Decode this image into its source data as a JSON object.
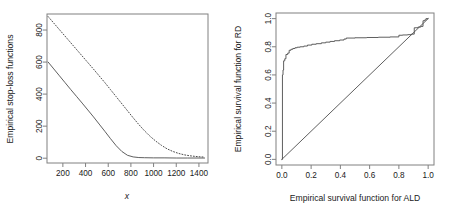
{
  "figure": {
    "panels": [
      {
        "id": "left",
        "name": "empirical-stop-loss-plot",
        "chart_ref": 0
      },
      {
        "id": "right",
        "name": "empirical-survival-pp-plot",
        "chart_ref": 1
      }
    ]
  },
  "chart_data": [
    {
      "type": "line",
      "title": "",
      "xlabel": "x",
      "ylabel": "Empirical stop-loss functions",
      "xlim": [
        60,
        1480
      ],
      "ylim": [
        -30,
        900
      ],
      "grid": false,
      "legend": null,
      "xticks": [
        200,
        400,
        600,
        800,
        1000,
        1200,
        1400
      ],
      "xticklabels": [
        "200",
        "400",
        "600",
        "800",
        "1000",
        "1200",
        "1400"
      ],
      "yticks": [
        0,
        200,
        400,
        600,
        800
      ],
      "yticklabels": [
        "0",
        "200",
        "400",
        "600",
        "800"
      ],
      "series": [
        {
          "name": "solid-stop-loss",
          "style": "solid",
          "color": "#4d4d4d",
          "x": [
            70,
            120,
            170,
            220,
            270,
            320,
            370,
            420,
            470,
            520,
            570,
            620,
            670,
            720,
            770,
            820,
            870,
            920,
            1000,
            1100,
            1200,
            1300,
            1400,
            1450
          ],
          "y": [
            600,
            557,
            514,
            471,
            428,
            386,
            344,
            301,
            258,
            213,
            168,
            122,
            78,
            42,
            18,
            8,
            4,
            3,
            2,
            2,
            1,
            1,
            1,
            1
          ]
        },
        {
          "name": "dotted-stop-loss",
          "style": "dotted",
          "color": "#4d4d4d",
          "x": [
            70,
            120,
            170,
            220,
            270,
            320,
            370,
            420,
            470,
            520,
            570,
            620,
            670,
            720,
            770,
            820,
            870,
            920,
            970,
            1020,
            1070,
            1120,
            1170,
            1220,
            1270,
            1320,
            1370,
            1420,
            1450
          ],
          "y": [
            884,
            843,
            802,
            761,
            720,
            679,
            638,
            597,
            556,
            514,
            472,
            428,
            384,
            340,
            296,
            252,
            210,
            171,
            136,
            106,
            80,
            58,
            42,
            30,
            21,
            15,
            11,
            8,
            7
          ]
        }
      ]
    },
    {
      "type": "line",
      "title": "",
      "xlabel": "Empirical survival function for ALD",
      "ylabel": "Empirical survival function for RD",
      "xlim": [
        -0.04,
        1.04
      ],
      "ylim": [
        -0.04,
        1.04
      ],
      "grid": false,
      "legend": null,
      "xticks": [
        0.0,
        0.2,
        0.4,
        0.6,
        0.8,
        1.0
      ],
      "xticklabels": [
        "0.0",
        "0.2",
        "0.4",
        "0.6",
        "0.8",
        "1.0"
      ],
      "yticks": [
        0.0,
        0.2,
        0.4,
        0.6,
        0.8,
        1.0
      ],
      "yticklabels": [
        "0.0",
        "0.2",
        "0.4",
        "0.6",
        "0.8",
        "1.0"
      ],
      "series": [
        {
          "name": "reference-diagonal",
          "style": "solid",
          "color": "#4d4d4d",
          "x": [
            0.0,
            1.0
          ],
          "y": [
            0.0,
            1.0
          ]
        },
        {
          "name": "empirical-pp-step",
          "style": "step",
          "color": "#4d4d4d",
          "x": [
            0.0,
            0.004,
            0.004,
            0.008,
            0.008,
            0.012,
            0.012,
            0.02,
            0.02,
            0.028,
            0.028,
            0.04,
            0.04,
            0.05,
            0.05,
            0.062,
            0.062,
            0.075,
            0.075,
            0.09,
            0.09,
            0.105,
            0.105,
            0.125,
            0.125,
            0.15,
            0.15,
            0.175,
            0.175,
            0.205,
            0.205,
            0.235,
            0.235,
            0.27,
            0.27,
            0.3,
            0.3,
            0.33,
            0.33,
            0.36,
            0.36,
            0.395,
            0.395,
            0.425,
            0.425,
            0.44,
            0.44,
            0.5,
            0.5,
            0.58,
            0.58,
            0.66,
            0.66,
            0.74,
            0.74,
            0.8,
            0.8,
            0.825,
            0.825,
            0.86,
            0.86,
            0.885,
            0.885,
            0.905,
            0.905,
            0.93,
            0.93,
            0.95,
            0.95,
            0.965,
            0.965,
            0.975,
            0.975,
            0.985,
            0.985,
            1.0
          ],
          "y": [
            0.0,
            0.0,
            0.6,
            0.6,
            0.635,
            0.635,
            0.7,
            0.7,
            0.715,
            0.715,
            0.745,
            0.745,
            0.755,
            0.755,
            0.775,
            0.775,
            0.782,
            0.782,
            0.788,
            0.788,
            0.793,
            0.793,
            0.797,
            0.797,
            0.8,
            0.8,
            0.805,
            0.805,
            0.812,
            0.812,
            0.818,
            0.818,
            0.822,
            0.822,
            0.828,
            0.828,
            0.833,
            0.833,
            0.838,
            0.838,
            0.843,
            0.843,
            0.848,
            0.848,
            0.855,
            0.855,
            0.862,
            0.862,
            0.864,
            0.864,
            0.866,
            0.866,
            0.868,
            0.868,
            0.87,
            0.87,
            0.882,
            0.882,
            0.884,
            0.884,
            0.886,
            0.886,
            0.89,
            0.89,
            0.935,
            0.935,
            0.94,
            0.94,
            0.945,
            0.945,
            0.985,
            0.985,
            0.99,
            0.99,
            1.0,
            1.0
          ]
        }
      ]
    }
  ],
  "colors": {
    "line": "#4d4d4d",
    "axis": "#808080",
    "text": "#1a1a1a",
    "background": "#ffffff"
  }
}
